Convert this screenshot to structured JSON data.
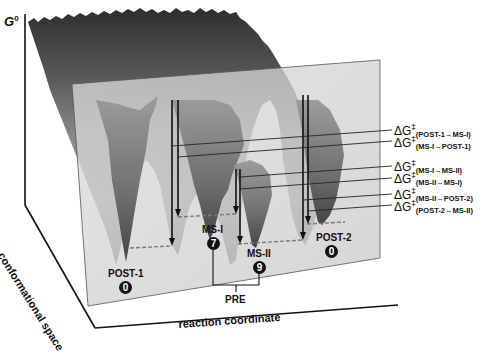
{
  "figure": {
    "axes": {
      "y_label": "G",
      "y_label_superscript": "0",
      "depth_label": "conformational space",
      "x_label": "reaction coordinate"
    },
    "states": [
      {
        "name": "POST-1",
        "count": "0"
      },
      {
        "name": "MS-I",
        "count": "7"
      },
      {
        "name": "MS-II",
        "count": "9"
      },
      {
        "name": "POST-2",
        "count": "0"
      }
    ],
    "group_label": "PRE",
    "barriers": [
      {
        "symbol": "ΔG",
        "dagger": "‡",
        "subscript": "(POST-1→MS-I)"
      },
      {
        "symbol": "ΔG",
        "dagger": "‡",
        "subscript": "(MS-I→POST-1)"
      },
      {
        "symbol": "ΔG",
        "dagger": "‡",
        "subscript": "(MS-I→MS-II)"
      },
      {
        "symbol": "ΔG",
        "dagger": "‡",
        "subscript": "(MS-II→MS-I)"
      },
      {
        "symbol": "ΔG",
        "dagger": "‡",
        "subscript": "(MS-II→POST-2)"
      },
      {
        "symbol": "ΔG",
        "dagger": "‡",
        "subscript": "(POST-2→MS-II)"
      }
    ],
    "colors": {
      "surface_dark": "#3a3a3a",
      "surface_mid": "#7a7a7a",
      "surface_light": "#b8b8b8",
      "plane": "#d4d4d4",
      "ink": "#111111"
    }
  }
}
